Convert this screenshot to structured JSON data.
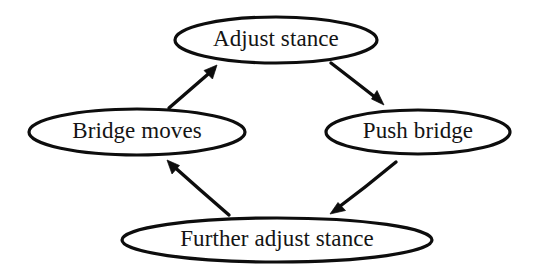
{
  "diagram": {
    "type": "cycle-flow-diagram",
    "title": "",
    "background_color": "#ffffff",
    "stroke_color": "#0d0d0d",
    "text_color": "#141414",
    "canvas": {
      "width": 534,
      "height": 275
    },
    "nodes": [
      {
        "id": "adjust-stance",
        "label": "Adjust stance",
        "shape": "ellipse",
        "cx": 276,
        "cy": 40,
        "rx": 101,
        "ry": 23,
        "font_size": 23
      },
      {
        "id": "push-bridge",
        "label": "Push bridge",
        "shape": "ellipse",
        "cx": 418,
        "cy": 132,
        "rx": 92,
        "ry": 22,
        "font_size": 23
      },
      {
        "id": "further-adjust-stance",
        "label": "Further adjust stance",
        "shape": "ellipse",
        "cx": 277,
        "cy": 240,
        "rx": 155,
        "ry": 22,
        "font_size": 23
      },
      {
        "id": "bridge-moves",
        "label": "Bridge moves",
        "shape": "ellipse",
        "cx": 137,
        "cy": 132,
        "rx": 108,
        "ry": 23,
        "font_size": 23
      }
    ],
    "edges": [
      {
        "id": "edge-adjust-to-push",
        "from": "adjust-stance",
        "to": "push-bridge",
        "label": "",
        "x1": 331,
        "y1": 63,
        "x2": 383,
        "y2": 104,
        "arrowhead": "to"
      },
      {
        "id": "edge-push-to-further",
        "from": "push-bridge",
        "to": "further-adjust-stance",
        "label": "",
        "x1": 396,
        "y1": 162,
        "x2": 331,
        "y2": 213,
        "arrowhead": "to"
      },
      {
        "id": "edge-further-to-bridge",
        "from": "further-adjust-stance",
        "to": "bridge-moves",
        "label": "",
        "x1": 229,
        "y1": 215,
        "x2": 168,
        "y2": 161,
        "arrowhead": "to"
      },
      {
        "id": "edge-bridge-to-adjust",
        "from": "bridge-moves",
        "to": "adjust-stance",
        "label": "",
        "x1": 169,
        "y1": 108,
        "x2": 217,
        "y2": 66,
        "arrowhead": "to"
      }
    ]
  }
}
